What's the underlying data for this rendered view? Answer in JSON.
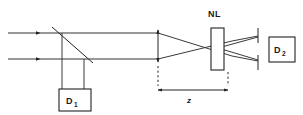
{
  "figure": {
    "type": "optical-setup-diagram",
    "background_color": "#ffffff",
    "line_color": "#222222",
    "width": 303,
    "height": 115
  },
  "labels": {
    "nonlinear_sample": "NL",
    "detector_one": "D",
    "detector_one_subscript": "1",
    "detector_two": "D",
    "detector_two_subscript": "2",
    "distance": "z"
  },
  "components": {
    "input_beams": {
      "name": "input-laser-beams",
      "count": 2,
      "direction": "rightward",
      "upper_y": 33,
      "lower_y": 59,
      "start_x": 8,
      "arrow_x": 40
    },
    "beamsplitter": {
      "name": "beamsplitter",
      "x1": 52,
      "y1": 27,
      "x2": 93,
      "y2": 63,
      "orientation": "diagonal"
    },
    "reference_arm": {
      "name": "reference-arm-to-d1",
      "left_x": 62,
      "right_x": 84,
      "top_y": 35,
      "bottom_y": 89
    },
    "lens": {
      "name": "focusing-lens",
      "x": 158,
      "top_y": 29,
      "bottom_y": 63,
      "symbol": "double-headed-arrow"
    },
    "sample": {
      "name": "nonlinear-sample",
      "x": 211,
      "y": 28,
      "width": 13,
      "height": 42
    },
    "focus": {
      "name": "beam-focus-point",
      "x": 218,
      "y": 48
    },
    "aperture": {
      "name": "aperture-slit",
      "x": 258,
      "upper_top_y": 28,
      "upper_bottom_y": 43,
      "lower_top_y": 55,
      "lower_bottom_y": 70
    },
    "detector_one_box": {
      "name": "detector-d1-box",
      "x": 59,
      "y": 89,
      "width": 32,
      "height": 22
    },
    "detector_two_box": {
      "name": "detector-d2-box",
      "x": 269,
      "y": 37,
      "width": 26,
      "height": 25
    },
    "distance_marker": {
      "name": "z-distance-marker",
      "start_x": 158,
      "end_x": 228,
      "y": 90,
      "dashed_top_lens_y": 66,
      "dashed_top_sample_y": 72
    }
  }
}
